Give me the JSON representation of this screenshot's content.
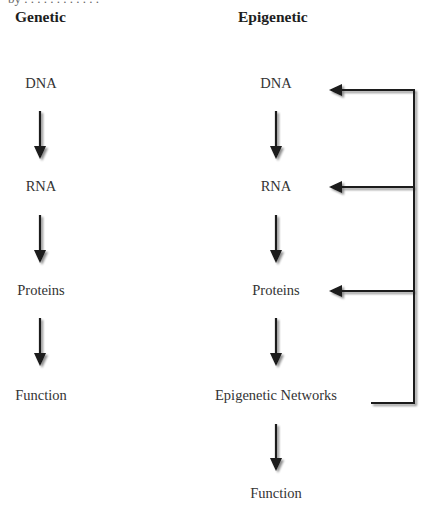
{
  "clipped_top_text": "by . . . . . .    . . . .  . .",
  "columns": {
    "genetic": {
      "heading": "Genetic",
      "nodes": [
        "DNA",
        "RNA",
        "Proteins",
        "Function"
      ]
    },
    "epigenetic": {
      "heading": "Epigenetic",
      "nodes": [
        "DNA",
        "RNA",
        "Proteins",
        "Epigenetic Networks",
        "Function"
      ]
    }
  },
  "feedback_loop": {
    "source": "Epigenetic Networks",
    "targets": [
      "DNA",
      "RNA",
      "Proteins"
    ]
  },
  "colors": {
    "arrow": "#1a1a1a",
    "text": "#333333",
    "shadow": "#bbbbbb"
  }
}
